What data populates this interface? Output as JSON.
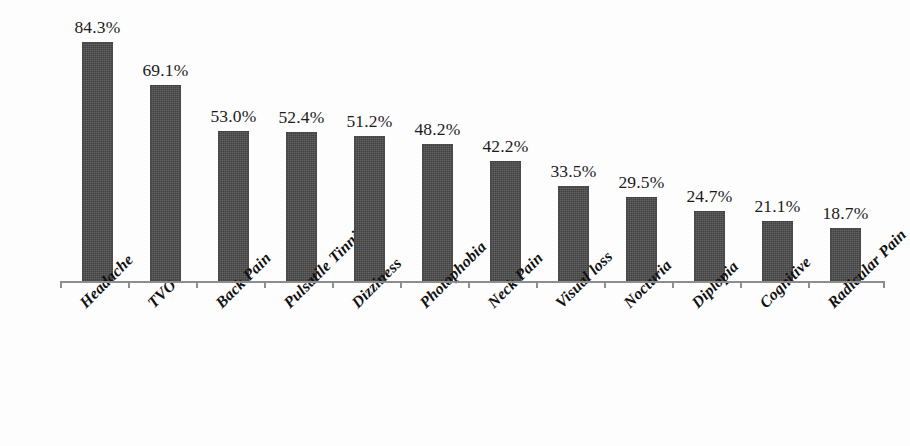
{
  "chart_data": {
    "type": "bar",
    "title": "",
    "subtitle": "",
    "xlabel": "",
    "ylabel": "",
    "ylim": [
      0,
      90
    ],
    "grid": false,
    "legend": "none",
    "orientation": "vertical",
    "value_label_suffix": "%",
    "categories": [
      "Headache",
      "TVO",
      "Back Pain",
      "Pulsatile Tinnitus",
      "Dizziness",
      "Photophobia",
      "Neck Pain",
      "Visual loss",
      "Nocturia",
      "Diplopia",
      "Cognitive",
      "Radicular Pain"
    ],
    "values": [
      84.3,
      69.1,
      53.0,
      52.4,
      51.2,
      48.2,
      42.2,
      33.5,
      29.5,
      24.7,
      21.1,
      18.7
    ],
    "value_labels": [
      "84.3%",
      "69.1%",
      "53.0%",
      "52.4%",
      "51.2%",
      "48.2%",
      "42.2%",
      "33.5%",
      "29.5%",
      "24.7%",
      "21.1%",
      "18.7%"
    ],
    "series": [
      {
        "name": "Symptom prevalence",
        "values": [
          84.3,
          69.1,
          53.0,
          52.4,
          51.2,
          48.2,
          42.2,
          33.5,
          29.5,
          24.7,
          21.1,
          18.7
        ]
      }
    ],
    "colors": {
      "bar_fill": "#4b4b4b",
      "axis": "#8d8d8d",
      "text": "#1b1b1b",
      "background": "#fdfdfd"
    }
  }
}
